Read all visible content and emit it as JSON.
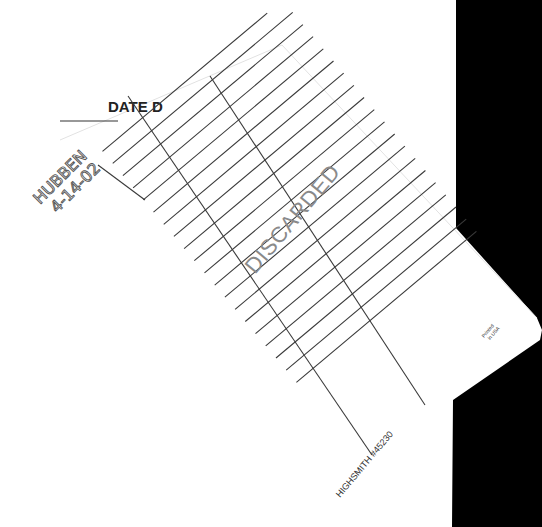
{
  "card": {
    "header": "DATE D",
    "stamp": "DISCARDED",
    "handwriting": {
      "line1": "HUBBEN",
      "line2": "4-14-02"
    },
    "manufacturer": "HIGHSMITH #45230",
    "printed": {
      "line1": "Printed",
      "line2": "in USA"
    }
  },
  "colors": {
    "background": "#ffffff",
    "backdrop": "#000000",
    "ink": "#3a3a3a",
    "stamp": "#8a8a8a"
  }
}
